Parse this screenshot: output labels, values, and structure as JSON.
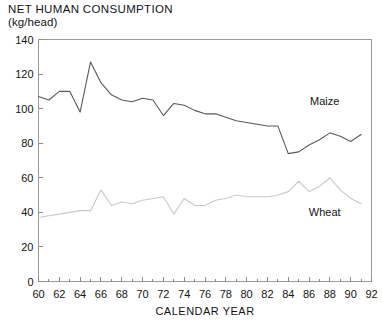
{
  "figure": {
    "title_line1": "NET HUMAN CONSUMPTION",
    "title_line2": "(kg/head)"
  },
  "chart_data": {
    "type": "line",
    "title": "NET HUMAN CONSUMPTION (kg/head)",
    "xlabel": "CALENDAR YEAR",
    "ylabel": "",
    "xlim": [
      60,
      92
    ],
    "ylim": [
      0,
      140
    ],
    "xticks": [
      60,
      62,
      64,
      66,
      68,
      70,
      72,
      74,
      76,
      78,
      80,
      82,
      84,
      86,
      88,
      90,
      92
    ],
    "xtick_labels": [
      "60",
      "62",
      "64",
      "66",
      "68",
      "70",
      "72",
      "74",
      "76",
      "78",
      "80",
      "82",
      "84",
      "86",
      "88",
      "90",
      "92"
    ],
    "yticks": [
      0,
      20,
      40,
      60,
      80,
      100,
      120,
      140
    ],
    "ytick_labels": [
      "0",
      "20",
      "40",
      "60",
      "80",
      "100",
      "120",
      "140"
    ],
    "minor_xticks_every": 1,
    "grid": false,
    "legend": "inline-annotations",
    "x": [
      60,
      61,
      62,
      63,
      64,
      65,
      66,
      67,
      68,
      69,
      70,
      71,
      72,
      73,
      74,
      75,
      76,
      77,
      78,
      79,
      80,
      81,
      82,
      83,
      84,
      85,
      86,
      87,
      88,
      89,
      90,
      91
    ],
    "series": [
      {
        "name": "Maize",
        "color": "#595959",
        "label_x": 87.5,
        "label_y": 102,
        "values": [
          107,
          105,
          110,
          110,
          98,
          127,
          115,
          108,
          105,
          104,
          106,
          105,
          96,
          103,
          102,
          99,
          97,
          97,
          95,
          93,
          92,
          91,
          90,
          90,
          74,
          75,
          79,
          82,
          86,
          84,
          81,
          85
        ]
      },
      {
        "name": "Wheat",
        "color": "#c9c9c9",
        "label_x": 87.5,
        "label_y": 38,
        "values": [
          37,
          38,
          39,
          40,
          41,
          41,
          53,
          44,
          46,
          45,
          47,
          48,
          49,
          39,
          48,
          44,
          44,
          47,
          48,
          50,
          49,
          49,
          49,
          50,
          52,
          58,
          52,
          55,
          60,
          53,
          48,
          45
        ]
      }
    ]
  }
}
